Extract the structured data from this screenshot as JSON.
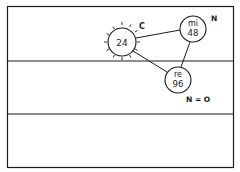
{
  "diagram": {
    "nodes": [
      {
        "id": "c-node",
        "lines": [
          "24"
        ],
        "label": "C",
        "rays": true
      },
      {
        "id": "mi-node",
        "lines": [
          "mi",
          "48"
        ],
        "label": "N"
      },
      {
        "id": "re-node",
        "lines": [
          "re",
          "96"
        ],
        "label": "N = O"
      }
    ],
    "edges": [
      {
        "from": "c-node",
        "to": "mi-node"
      },
      {
        "from": "c-node",
        "to": "re-node"
      },
      {
        "from": "mi-node",
        "to": "re-node"
      }
    ],
    "colors": {
      "ink": "#1a1a1a",
      "background": "#ffffff"
    }
  }
}
